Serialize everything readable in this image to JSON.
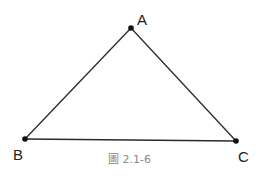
{
  "figure": {
    "caption": "圖 2.1-6",
    "points": [
      {
        "name": "A",
        "x": 131,
        "y": 28,
        "label_x": 137,
        "label_y": 25
      },
      {
        "name": "B",
        "x": 25,
        "y": 139,
        "label_x": 13,
        "label_y": 159
      },
      {
        "name": "C",
        "x": 236,
        "y": 141,
        "label_x": 238,
        "label_y": 161
      }
    ],
    "segments": [
      [
        "A",
        "B"
      ],
      [
        "B",
        "C"
      ],
      [
        "C",
        "A"
      ]
    ],
    "colors": {
      "line": "#2a2a2a",
      "point": "#111111",
      "caption": "#888888"
    }
  }
}
